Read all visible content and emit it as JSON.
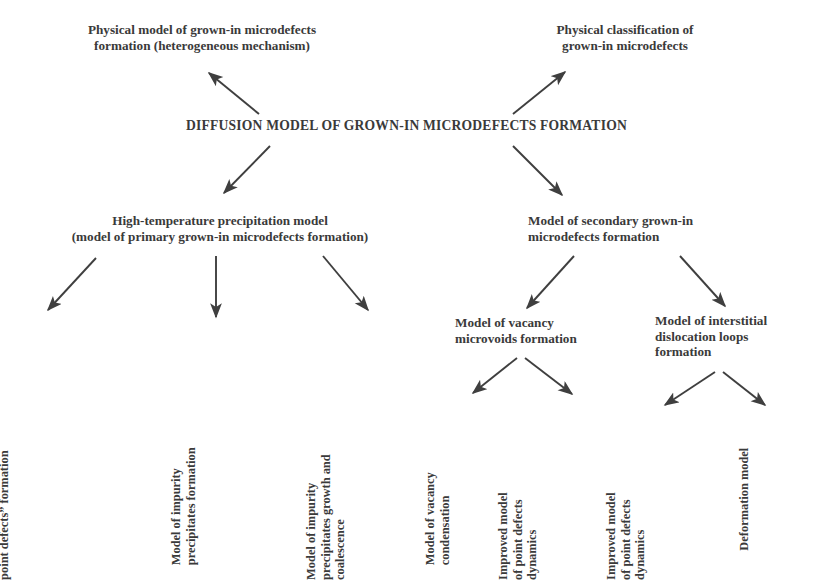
{
  "diagram": {
    "title": "DIFFUSION MODEL OF GROWN-IN MICRODEFECTS FORMATION",
    "root": {
      "label": "DIFFUSION MODEL OF GROWN-IN MICRODEFECTS FORMATION"
    },
    "nodes": {
      "physical_model": "Physical model of grown-in microdefects\nformation (heterogeneous mechanism)",
      "physical_classification": "Physical classification of\ngrown-in microdefects",
      "high_temperature": "High-temperature precipitation model\n(model of primary grown-in microdefects formation)",
      "secondary": "Model of secondary grown-in\nmicrodefects formation",
      "complexes": "Model of complexes\n“impurity + intrinsic\npoint defects” formation",
      "impurity_precipitates": "Model of impurity\nprecipitates formation",
      "impurity_growth": "Model of impurity\nprecipitates growth and\ncoalescence",
      "vacancy_microvoids": "Model of vacancy\nmicrovoids formation",
      "interstitial_loops": "Model of interstitial\ndislocation loops\nformation",
      "vacancy_condensation": "Model of vacancy\ncondensation",
      "improved_point_defects_left": "Improved model\nof point defects\ndynamics",
      "improved_point_defects_right": "Improved model\nof point defects\ndynamics",
      "deformation": "Deformation model"
    },
    "colors": {
      "text": "#3a3a3a",
      "arrow": "#3f3f3f",
      "background": "#ffffff"
    },
    "edges": [
      {
        "from": "root",
        "to": "physical_model"
      },
      {
        "from": "root",
        "to": "physical_classification"
      },
      {
        "from": "root",
        "to": "high_temperature"
      },
      {
        "from": "root",
        "to": "secondary"
      },
      {
        "from": "high_temperature",
        "to": "complexes"
      },
      {
        "from": "high_temperature",
        "to": "impurity_precipitates"
      },
      {
        "from": "high_temperature",
        "to": "impurity_growth"
      },
      {
        "from": "secondary",
        "to": "vacancy_microvoids"
      },
      {
        "from": "secondary",
        "to": "interstitial_loops"
      },
      {
        "from": "vacancy_microvoids",
        "to": "vacancy_condensation"
      },
      {
        "from": "vacancy_microvoids",
        "to": "improved_point_defects_left"
      },
      {
        "from": "interstitial_loops",
        "to": "improved_point_defects_right"
      },
      {
        "from": "interstitial_loops",
        "to": "deformation"
      }
    ]
  }
}
